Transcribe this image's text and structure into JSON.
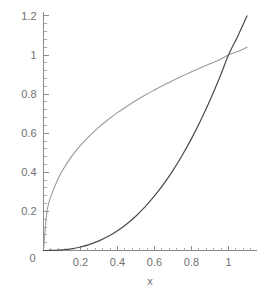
{
  "chart_data": {
    "type": "line",
    "title": "",
    "subtitle": "",
    "xlabel": "x",
    "ylabel": "",
    "xlim": [
      0,
      1.12
    ],
    "ylim": [
      0,
      1.24
    ],
    "grid": false,
    "legend": null,
    "x_ticks": [
      "0",
      "0.2",
      "0.4",
      "0.6",
      "0.8",
      "1"
    ],
    "x_tick_values": [
      0,
      0.2,
      0.4,
      0.6,
      0.8,
      1
    ],
    "y_ticks": [
      "0",
      "0.2",
      "0.4",
      "0.6",
      "0.8",
      "1",
      "1.2"
    ],
    "y_tick_values": [
      0,
      0.2,
      0.4,
      0.6,
      0.8,
      1,
      1.2
    ],
    "x_minor_count": 4,
    "y_minor_count": 4,
    "x": [
      0,
      0.02,
      0.05,
      0.08,
      0.1,
      0.15,
      0.2,
      0.25,
      0.3,
      0.35,
      0.4,
      0.45,
      0.5,
      0.55,
      0.6,
      0.65,
      0.7,
      0.75,
      0.8,
      0.85,
      0.9,
      0.95,
      1.0,
      1.05,
      1.1
    ],
    "series": [
      {
        "name": "upper-curve",
        "color": "#9a9a9a",
        "width": 1.1,
        "values": [
          0,
          0.208,
          0.302,
          0.368,
          0.405,
          0.479,
          0.538,
          0.588,
          0.631,
          0.67,
          0.705,
          0.737,
          0.767,
          0.795,
          0.821,
          0.846,
          0.87,
          0.892,
          0.914,
          0.935,
          0.955,
          0.975,
          1.0,
          1.018,
          1.04
        ]
      },
      {
        "name": "lower-curve",
        "color": "#4a4a4a",
        "width": 1.2,
        "values": [
          0,
          0.0001,
          0.0006,
          0.0018,
          0.0032,
          0.0087,
          0.0179,
          0.0313,
          0.0493,
          0.0725,
          0.1012,
          0.1358,
          0.1768,
          0.2244,
          0.2789,
          0.3407,
          0.4099,
          0.4871,
          0.5723,
          0.6659,
          0.7682,
          0.8793,
          1.0,
          1.0964,
          1.2
        ]
      }
    ]
  },
  "axes": {
    "x_axis_label": "x",
    "origin_label": "0"
  }
}
